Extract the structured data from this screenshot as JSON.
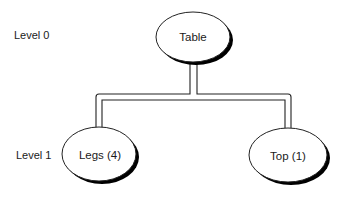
{
  "diagram": {
    "type": "hierarchy-tree",
    "levels": [
      {
        "label": "Level 0",
        "y": 35
      },
      {
        "label": "Level 1",
        "y": 155
      }
    ],
    "nodes": [
      {
        "id": "table",
        "label": "Table",
        "level": 0,
        "cx": 193,
        "cy": 37,
        "rx": 37,
        "ry": 25
      },
      {
        "id": "legs",
        "label": "Legs (4)",
        "level": 1,
        "cx": 99,
        "cy": 154,
        "rx": 37,
        "ry": 27
      },
      {
        "id": "top",
        "label": "Top (1)",
        "level": 1,
        "cx": 288,
        "cy": 155,
        "rx": 39,
        "ry": 27
      }
    ],
    "edges": [
      {
        "from": "table",
        "to": "legs"
      },
      {
        "from": "table",
        "to": "top"
      }
    ],
    "colors": {
      "stroke": "#222222",
      "shadow": "#000000",
      "fill": "#ffffff",
      "text": "#1a1a1a"
    }
  }
}
